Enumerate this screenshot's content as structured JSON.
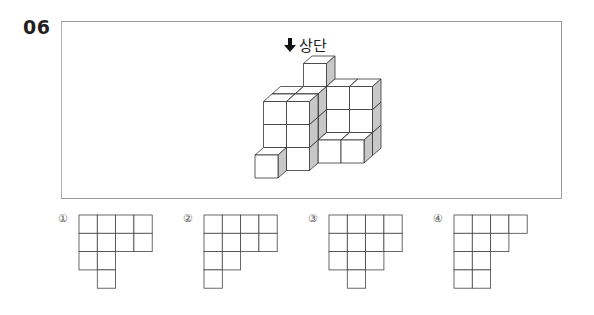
{
  "question": {
    "number": "06",
    "direction_label": "상단",
    "direction_icon": "arrow-down-icon"
  },
  "figure": {
    "colors": {
      "face_front": "#ffffff",
      "face_side": "#c8c8c8",
      "face_top": "#ffffff",
      "stroke": "#333333",
      "frame": "#9a9a9a"
    }
  },
  "options": [
    {
      "marker": "①",
      "rows": [
        [
          1,
          1,
          1,
          1
        ],
        [
          1,
          1,
          1,
          1
        ],
        [
          1,
          1,
          0,
          0
        ],
        [
          0,
          1,
          0,
          0
        ]
      ]
    },
    {
      "marker": "②",
      "rows": [
        [
          1,
          1,
          1,
          1
        ],
        [
          1,
          1,
          1,
          1
        ],
        [
          1,
          1,
          0,
          0
        ],
        [
          1,
          0,
          0,
          0
        ]
      ]
    },
    {
      "marker": "③",
      "rows": [
        [
          1,
          1,
          1,
          1
        ],
        [
          1,
          1,
          1,
          1
        ],
        [
          1,
          1,
          1,
          0
        ],
        [
          0,
          1,
          0,
          0
        ]
      ]
    },
    {
      "marker": "④",
      "rows": [
        [
          1,
          1,
          1,
          1
        ],
        [
          1,
          1,
          1,
          0
        ],
        [
          1,
          1,
          0,
          0
        ],
        [
          1,
          1,
          0,
          0
        ]
      ]
    }
  ]
}
